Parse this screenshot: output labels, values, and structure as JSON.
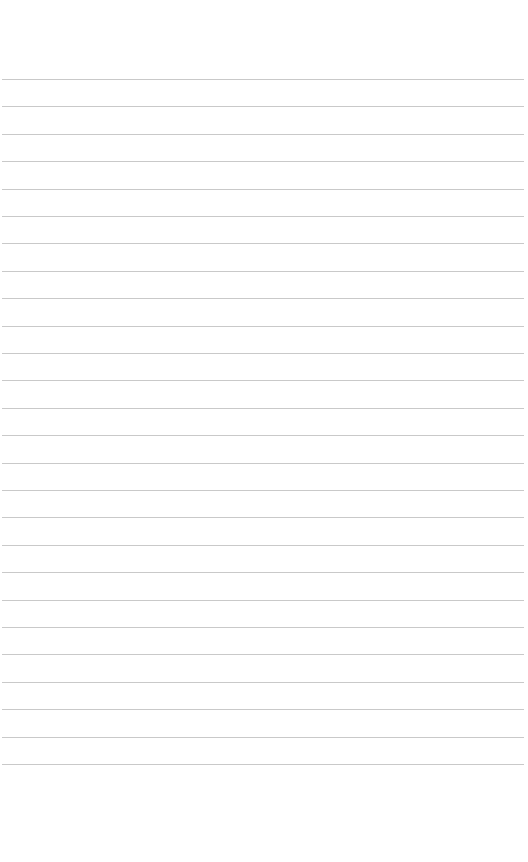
{
  "page": {
    "type": "blank ruled notebook page",
    "background": "#ffffff",
    "line_color": "#c9c9c9",
    "line_count": 26,
    "first_line_y": 79,
    "line_spacing": 27.4
  }
}
